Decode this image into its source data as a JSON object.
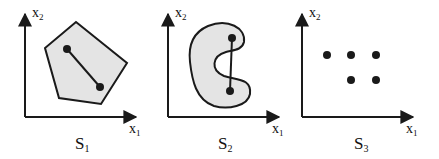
{
  "colors": {
    "stroke": "#1a1a1a",
    "fill": "#e4e4e4",
    "background": "#ffffff"
  },
  "panels": [
    {
      "name": "S1",
      "set_label": "S",
      "set_sub": "1",
      "x_axis_label": "x",
      "x_axis_sub": "1",
      "y_axis_label": "x",
      "y_axis_sub": "2",
      "shape": "pentagon",
      "description": "convex pentagon with a line segment between two interior points"
    },
    {
      "name": "S2",
      "set_label": "S",
      "set_sub": "2",
      "x_axis_label": "x",
      "x_axis_sub": "1",
      "y_axis_label": "x",
      "y_axis_sub": "2",
      "shape": "c-shape",
      "description": "non-convex C-shaped region; the segment between two points leaves the set"
    },
    {
      "name": "S3",
      "set_label": "S",
      "set_sub": "3",
      "x_axis_label": "x",
      "x_axis_sub": "1",
      "y_axis_label": "x",
      "y_axis_sub": "2",
      "shape": "discrete-points",
      "description": "discrete set of five points (3 in top row, 2 in bottom row)"
    }
  ]
}
